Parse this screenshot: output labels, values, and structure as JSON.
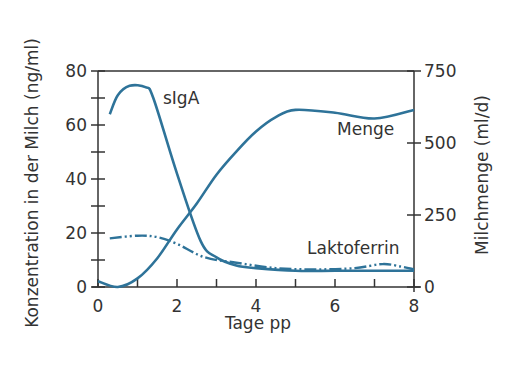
{
  "chart_data": {
    "type": "line",
    "title": "",
    "xlabel": "Tage pp",
    "ylabel": "Konzentration in der Milch (ng/ml)",
    "y2label": "Milchmenge (ml/d)",
    "xlim": [
      0,
      8
    ],
    "ylim": [
      0,
      80
    ],
    "y2lim": [
      0,
      750
    ],
    "x_ticks": [
      "0",
      "2",
      "4",
      "6",
      "8"
    ],
    "y_ticks": [
      "0",
      "20",
      "40",
      "60",
      "80"
    ],
    "y2_ticks": [
      "0",
      "250",
      "500",
      "750"
    ],
    "grid": false,
    "legend": "inline labels",
    "series": [
      {
        "name": "sIgA",
        "axis": "left",
        "style": "solid",
        "color": "#2e7399",
        "x": [
          0.3,
          0.5,
          0.8,
          1.2,
          1.4,
          2.0,
          2.6,
          3.0,
          3.5,
          4.0,
          5.0,
          6.0,
          7.0,
          8.0
        ],
        "values": [
          64,
          71,
          74.5,
          74,
          70,
          42,
          17,
          11,
          8,
          7,
          6,
          6,
          6,
          6
        ]
      },
      {
        "name": "Menge",
        "axis": "right",
        "style": "solid",
        "color": "#2e7399",
        "x": [
          0,
          0.5,
          1.0,
          1.5,
          2.0,
          2.5,
          3.0,
          3.5,
          4.0,
          4.5,
          5.0,
          6.0,
          7.0,
          8.0
        ],
        "values": [
          20,
          0,
          30,
          100,
          200,
          290,
          390,
          470,
          540,
          590,
          615,
          605,
          585,
          615
        ]
      },
      {
        "name": "Laktoferrin",
        "axis": "left",
        "style": "dash-dot-dot",
        "color": "#2e7399",
        "x": [
          0.3,
          1.0,
          1.5,
          2.0,
          2.7,
          3.5,
          4.5,
          5.5,
          6.5,
          7.2,
          7.7,
          8.0
        ],
        "values": [
          18,
          19,
          18.5,
          16,
          11,
          9,
          7,
          6.5,
          7,
          8.5,
          7.5,
          6.5
        ]
      }
    ],
    "annotations": [
      {
        "text": "sIgA",
        "x": 1.65,
        "y": 74
      },
      {
        "text": "Menge",
        "x": 5.3,
        "y": 58
      },
      {
        "text": "Laktoferrin",
        "x": 5.2,
        "y": 15
      }
    ]
  }
}
